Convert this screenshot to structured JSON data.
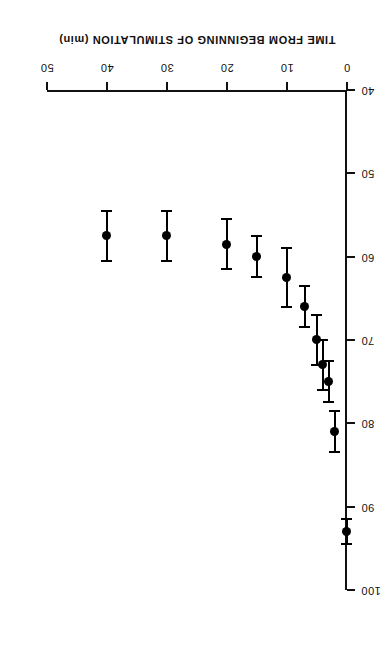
{
  "figure": {
    "orientation": "rotated-180",
    "background_color": "#ffffff",
    "ink_color": "#000000"
  },
  "axes": {
    "x_title": "TIME FROM BEGINNING OF STIMULATION (min)",
    "y_title": "MUSCLE GROUP TENSION DEVELOPMENT  (% of original)",
    "x_ticks": [
      "0",
      "10",
      "20",
      "30",
      "40",
      "50"
    ],
    "y_ticks": [
      "40",
      "50",
      "60",
      "70",
      "80",
      "90",
      "100"
    ]
  },
  "chart_data": {
    "type": "scatter",
    "title": "",
    "xlabel": "TIME FROM BEGINNING OF STIMULATION (min)",
    "ylabel": "MUSCLE GROUP TENSION DEVELOPMENT  (% of original)",
    "xlim": [
      0,
      50
    ],
    "ylim": [
      40,
      100
    ],
    "xticks": [
      0,
      10,
      20,
      30,
      40,
      50
    ],
    "yticks": [
      40,
      50,
      60,
      70,
      80,
      90,
      100
    ],
    "grid": false,
    "legend": null,
    "error_bars": "horizontal-in-printed-orientation (SEM on tension)",
    "x": [
      0,
      2,
      3,
      4,
      5,
      7,
      10,
      15,
      20,
      30,
      40
    ],
    "y": [
      93.0,
      81.0,
      75.0,
      73.0,
      70.0,
      66.0,
      62.5,
      60.0,
      58.5,
      57.5,
      57.5
    ],
    "yerr": [
      1.5,
      2.5,
      2.5,
      3.0,
      3.0,
      2.5,
      3.5,
      2.5,
      3.0,
      3.0,
      3.0
    ],
    "series": [
      {
        "name": "Muscle group tension development",
        "marker": "filled-circle",
        "color": "#000000",
        "points": [
          {
            "time_min": 0,
            "tension_pct": 93.0,
            "sem": 1.5
          },
          {
            "time_min": 2,
            "tension_pct": 81.0,
            "sem": 2.5
          },
          {
            "time_min": 3,
            "tension_pct": 75.0,
            "sem": 2.5
          },
          {
            "time_min": 4,
            "tension_pct": 73.0,
            "sem": 3.0
          },
          {
            "time_min": 5,
            "tension_pct": 70.0,
            "sem": 3.0
          },
          {
            "time_min": 7,
            "tension_pct": 66.0,
            "sem": 2.5
          },
          {
            "time_min": 10,
            "tension_pct": 62.5,
            "sem": 3.5
          },
          {
            "time_min": 15,
            "tension_pct": 60.0,
            "sem": 2.5
          },
          {
            "time_min": 20,
            "tension_pct": 58.5,
            "sem": 3.0
          },
          {
            "time_min": 30,
            "tension_pct": 57.5,
            "sem": 3.0
          },
          {
            "time_min": 40,
            "tension_pct": 57.5,
            "sem": 3.0
          }
        ]
      }
    ]
  }
}
